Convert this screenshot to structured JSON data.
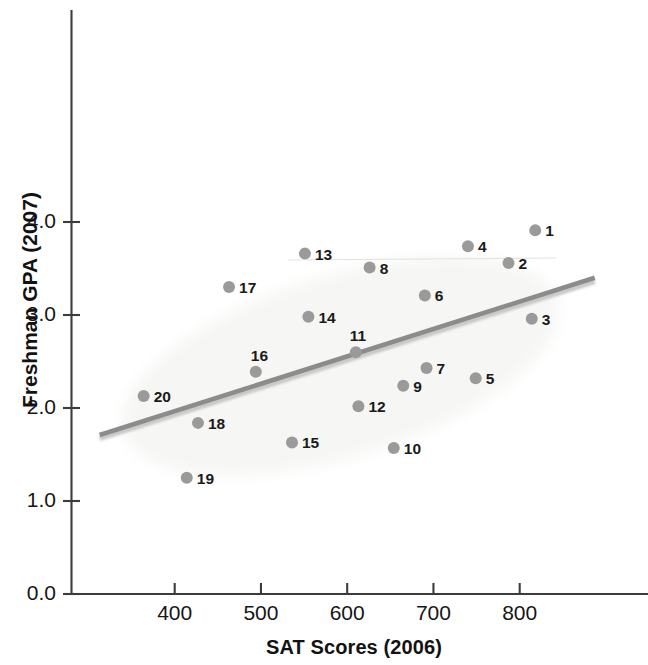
{
  "chart_data": {
    "type": "scatter",
    "title": "",
    "xlabel": "SAT Scores (2006)",
    "ylabel": "Freshman GPA (2007)",
    "xlim": [
      313,
      648
    ],
    "ylim": [
      0.0,
      4.4
    ],
    "xticks": [
      400,
      500,
      600,
      700,
      800
    ],
    "xtick_labels": [
      "400",
      "500",
      "600",
      "700",
      "800"
    ],
    "yticks": [
      0.0,
      1.0,
      2.0,
      3.0,
      4.0
    ],
    "ytick_labels": [
      "0.0",
      "1.0",
      "2.0",
      "3.0",
      "4.0"
    ],
    "grid": false,
    "legend": null,
    "marker_color": "#9a9a9a",
    "label_color": "#1a1a1a",
    "axis_color": "#3c3c3c",
    "trend_line": {
      "name": "regression line",
      "color": "#8c8c8c",
      "x_start": 313,
      "y_start": 1.71,
      "x_end": 887,
      "y_end": 3.4
    },
    "highlight_ellipse": {
      "name": "data-cloud-ellipse",
      "color": "#f6f6f4",
      "center_x": 592,
      "center_y": 2.45,
      "width_sat": 525,
      "height_gpa": 1.95,
      "rotation_deg": -17
    },
    "points": [
      {
        "label": "1",
        "x": 818,
        "y": 3.91,
        "label_dx": 10,
        "label_dy": -7
      },
      {
        "label": "2",
        "x": 787,
        "y": 3.56,
        "label_dx": 10,
        "label_dy": -7
      },
      {
        "label": "3",
        "x": 814,
        "y": 2.96,
        "label_dx": 10,
        "label_dy": -7
      },
      {
        "label": "4",
        "x": 740,
        "y": 3.74,
        "label_dx": 10,
        "label_dy": -7
      },
      {
        "label": "5",
        "x": 749,
        "y": 2.32,
        "label_dx": 10,
        "label_dy": -7
      },
      {
        "label": "6",
        "x": 690,
        "y": 3.21,
        "label_dx": 10,
        "label_dy": -7
      },
      {
        "label": "7",
        "x": 692,
        "y": 2.43,
        "label_dx": 10,
        "label_dy": -7
      },
      {
        "label": "8",
        "x": 626,
        "y": 3.51,
        "label_dx": 10,
        "label_dy": -7
      },
      {
        "label": "9",
        "x": 665,
        "y": 2.24,
        "label_dx": 10,
        "label_dy": -7
      },
      {
        "label": "10",
        "x": 654,
        "y": 1.57,
        "label_dx": 10,
        "label_dy": -7
      },
      {
        "label": "11",
        "x": 610,
        "y": 2.6,
        "label_dx": -6,
        "label_dy": -24
      },
      {
        "label": "12",
        "x": 613,
        "y": 2.02,
        "label_dx": 10,
        "label_dy": -7
      },
      {
        "label": "13",
        "x": 551,
        "y": 3.66,
        "label_dx": 10,
        "label_dy": -7
      },
      {
        "label": "14",
        "x": 555,
        "y": 2.98,
        "label_dx": 10,
        "label_dy": -7
      },
      {
        "label": "15",
        "x": 536,
        "y": 1.63,
        "label_dx": 10,
        "label_dy": -7
      },
      {
        "label": "16",
        "x": 494,
        "y": 2.39,
        "label_dx": -5,
        "label_dy": -24
      },
      {
        "label": "17",
        "x": 463,
        "y": 3.3,
        "label_dx": 10,
        "label_dy": -7
      },
      {
        "label": "18",
        "x": 427,
        "y": 1.84,
        "label_dx": 10,
        "label_dy": -7
      },
      {
        "label": "19",
        "x": 414,
        "y": 1.25,
        "label_dx": 10,
        "label_dy": -7
      },
      {
        "label": "20",
        "x": 364,
        "y": 2.13,
        "label_dx": 10,
        "label_dy": -7
      }
    ]
  },
  "axes": {
    "x_title": "SAT Scores (2006)",
    "y_title": "Freshman GPA (2007)",
    "x_tick_labels": [
      "400",
      "500",
      "600",
      "700",
      "800"
    ],
    "y_tick_labels": [
      "0.0",
      "1.0",
      "2.0",
      "3.0",
      "4.0"
    ]
  }
}
